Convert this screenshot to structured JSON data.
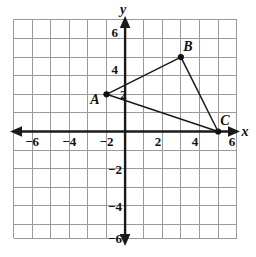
{
  "figure": {
    "axes": {
      "x_name": "x",
      "y_name": "y",
      "x_ticks": [
        {
          "value": -6,
          "label": "−6"
        },
        {
          "value": -4,
          "label": "−4"
        },
        {
          "value": -2,
          "label": "−2"
        },
        {
          "value": 2,
          "label": "2"
        },
        {
          "value": 4,
          "label": "4"
        },
        {
          "value": 6,
          "label": "6"
        }
      ],
      "y_ticks": [
        {
          "value": 6,
          "label": "6"
        },
        {
          "value": 4,
          "label": "4"
        },
        {
          "value": 2,
          "label": "2"
        },
        {
          "value": -2,
          "label": "−2"
        },
        {
          "value": -4,
          "label": "−4"
        },
        {
          "value": -6,
          "label": "−6"
        }
      ],
      "x_range": [
        -6,
        6
      ],
      "y_range": [
        -6,
        6
      ],
      "grid": true,
      "grid_color": "#9a9a9e",
      "axis_color": "#1a1a1a"
    },
    "points": [
      {
        "name": "A",
        "label": "A",
        "x": -1,
        "y": 2,
        "label_dx": -13,
        "label_dy": 9
      },
      {
        "name": "B",
        "label": "B",
        "x": 3,
        "y": 4,
        "label_dx": 5,
        "label_dy": -7
      },
      {
        "name": "C",
        "label": "C",
        "x": 5,
        "y": 0,
        "label_dx": 5,
        "label_dy": -7
      }
    ],
    "edges": [
      {
        "name": "edge-AB",
        "from": "A",
        "to": "B"
      },
      {
        "name": "edge-BC",
        "from": "B",
        "to": "C"
      },
      {
        "name": "edge-CA",
        "from": "C",
        "to": "A"
      }
    ],
    "shape_color": "#1a1a1a"
  }
}
